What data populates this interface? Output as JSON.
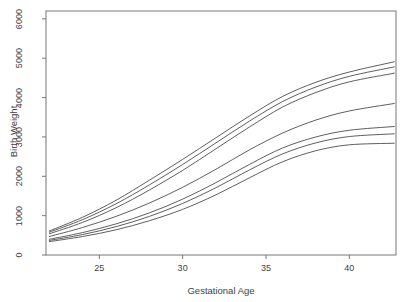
{
  "chart_data": {
    "type": "line",
    "title": "",
    "xlabel": "Gestational Age",
    "ylabel": "Birth Weight",
    "xlim": [
      21.8,
      42.8
    ],
    "ylim": [
      0,
      6200
    ],
    "xticks": [
      25,
      30,
      35,
      40
    ],
    "yticks": [
      0,
      1000,
      2000,
      3000,
      4000,
      5000,
      6000
    ],
    "xtick_labels": [
      "25",
      "30",
      "35",
      "40"
    ],
    "ytick_labels": [
      "0",
      "1000",
      "2000",
      "3000",
      "4000",
      "5000",
      "6000"
    ],
    "grid": false,
    "legend": "none",
    "box": "full",
    "line_color": "#4d4d4d",
    "background": "#ffffff",
    "x": [
      22,
      24,
      26,
      28,
      30,
      32,
      34,
      36,
      38,
      40,
      42.7
    ],
    "series": [
      {
        "name": "curve-1",
        "values": [
          610,
          960,
          1390,
          1900,
          2430,
          2980,
          3530,
          4030,
          4390,
          4650,
          4910
        ]
      },
      {
        "name": "curve-2",
        "values": [
          580,
          900,
          1300,
          1780,
          2300,
          2850,
          3400,
          3900,
          4270,
          4540,
          4780
        ]
      },
      {
        "name": "curve-3",
        "values": [
          540,
          830,
          1200,
          1650,
          2150,
          2700,
          3250,
          3760,
          4130,
          4400,
          4620
        ]
      },
      {
        "name": "curve-4",
        "values": [
          470,
          700,
          980,
          1320,
          1720,
          2180,
          2670,
          3100,
          3430,
          3660,
          3850
        ]
      },
      {
        "name": "curve-5",
        "values": [
          400,
          570,
          790,
          1070,
          1420,
          1840,
          2300,
          2720,
          3000,
          3170,
          3265
        ]
      },
      {
        "name": "curve-6",
        "values": [
          370,
          520,
          720,
          980,
          1310,
          1710,
          2160,
          2570,
          2850,
          3010,
          3080
        ]
      },
      {
        "name": "curve-7",
        "values": [
          340,
          470,
          640,
          870,
          1160,
          1530,
          1960,
          2370,
          2650,
          2800,
          2840
        ]
      }
    ]
  },
  "figure": {
    "plot_box": {
      "left": 46,
      "top": 11,
      "right": 396,
      "bottom": 255
    }
  }
}
